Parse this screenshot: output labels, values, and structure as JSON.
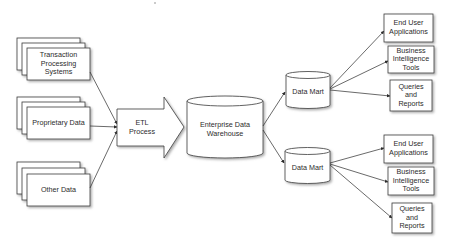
{
  "diagram": {
    "type": "data-warehouse-architecture",
    "colors": {
      "stroke": "#3a3a3a",
      "fill": "#ffffff",
      "shadow": "#9a9a9a",
      "text": "#2b2b2b"
    },
    "sources": [
      {
        "id": "transaction",
        "label": "Transaction\nProcessing\nSystems"
      },
      {
        "id": "proprietary",
        "label": "Proprietary Data"
      },
      {
        "id": "other",
        "label": "Other Data"
      }
    ],
    "etl": {
      "label": "ETL\nProcess"
    },
    "warehouse": {
      "label": "Enterprise Data\nWarehouse"
    },
    "data_marts": [
      {
        "id": "mart1",
        "label": "Data Mart"
      },
      {
        "id": "mart2",
        "label": "Data Mart"
      }
    ],
    "consumers": [
      {
        "mart": "mart1",
        "items": [
          {
            "label": "End User\nApplications"
          },
          {
            "label": "Business\nIntelligence\nTools"
          },
          {
            "label": "Queries\nand\nReports"
          }
        ]
      },
      {
        "mart": "mart2",
        "items": [
          {
            "label": "End User\nApplications"
          },
          {
            "label": "Business\nIntelligence\nTools"
          },
          {
            "label": "Queries\nand\nReports"
          }
        ]
      }
    ]
  }
}
